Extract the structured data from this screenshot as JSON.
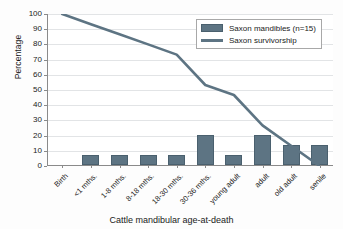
{
  "chart_data": {
    "type": "bar",
    "title": "",
    "subtitle": "",
    "xlabel": "Cattle mandibular age-at-death",
    "ylabel": "Percentage",
    "ylim": [
      0,
      100
    ],
    "ytick_step": 10,
    "grid": true,
    "legend_position": "top-right",
    "categories": [
      "Birth",
      "<1 mths.",
      "1-8 mths.",
      "8-18 mths.",
      "18-30 mths.",
      "30-36 mths.",
      "young adult",
      "adult",
      "old adult",
      "senile"
    ],
    "ytick_labels": [
      "0",
      "10",
      "20",
      "30",
      "40",
      "50",
      "60",
      "70",
      "80",
      "90",
      "100"
    ],
    "series": [
      {
        "name": "Saxon mandibles (n=15)",
        "type": "bar",
        "color": "#5d7483",
        "values": [
          0,
          6.7,
          6.7,
          6.7,
          6.7,
          20,
          6.7,
          20,
          13.3,
          13.3
        ]
      },
      {
        "name": "Saxon survivorship",
        "type": "line",
        "color": "#5d7483",
        "values": [
          100,
          93.3,
          86.7,
          80,
          73.3,
          53.3,
          46.7,
          26.7,
          13.3,
          0
        ]
      }
    ]
  },
  "legend": {
    "entries": [
      {
        "label": "Saxon mandibles (n=15)",
        "marker": "bar-swatch"
      },
      {
        "label": "Saxon survivorship",
        "marker": "line-swatch"
      }
    ]
  },
  "colors": {
    "series": "#5d7483",
    "series_border": "#4a606e",
    "gridline": "#e2e4e6",
    "axis": "#8a8a8a",
    "text": "#1a1a1a",
    "background": "#fdfdfd",
    "plot_background": "#ffffff"
  }
}
